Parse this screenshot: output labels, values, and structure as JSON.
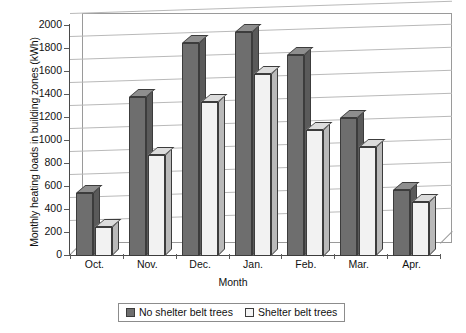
{
  "chart_data": {
    "type": "bar",
    "title": "",
    "xlabel": "Month",
    "ylabel": "Monthly heating loads in building zones (kWh)",
    "categories": [
      "Oct.",
      "Nov.",
      "Dec.",
      "Jan.",
      "Feb.",
      "Mar.",
      "Apr."
    ],
    "series": [
      {
        "name": "No shelter belt trees",
        "values": [
          550,
          1380,
          1850,
          1950,
          1750,
          1200,
          570
        ],
        "color": "#6e6e6e"
      },
      {
        "name": "Shelter belt trees",
        "values": [
          250,
          880,
          1340,
          1580,
          1100,
          950,
          470
        ],
        "color": "#f2f2f2"
      }
    ],
    "ylim": [
      0,
      2000
    ],
    "yticks": [
      0,
      200,
      400,
      600,
      800,
      1000,
      1200,
      1400,
      1600,
      1800,
      2000
    ],
    "ytick_labels": [
      "0",
      "200",
      "400",
      "600",
      "800",
      "1000",
      "1200",
      "1400",
      "1600",
      "1800",
      "2000"
    ],
    "grid": true,
    "legend_position": "bottom",
    "style": "3d-column"
  },
  "legend": {
    "items": [
      {
        "label": "No shelter belt trees",
        "swatch": "dark"
      },
      {
        "label": "Shelter belt trees",
        "swatch": "light"
      }
    ]
  },
  "axes": {
    "x_title": "Month",
    "y_title": "Monthly heating loads in building zones (kWh)"
  }
}
